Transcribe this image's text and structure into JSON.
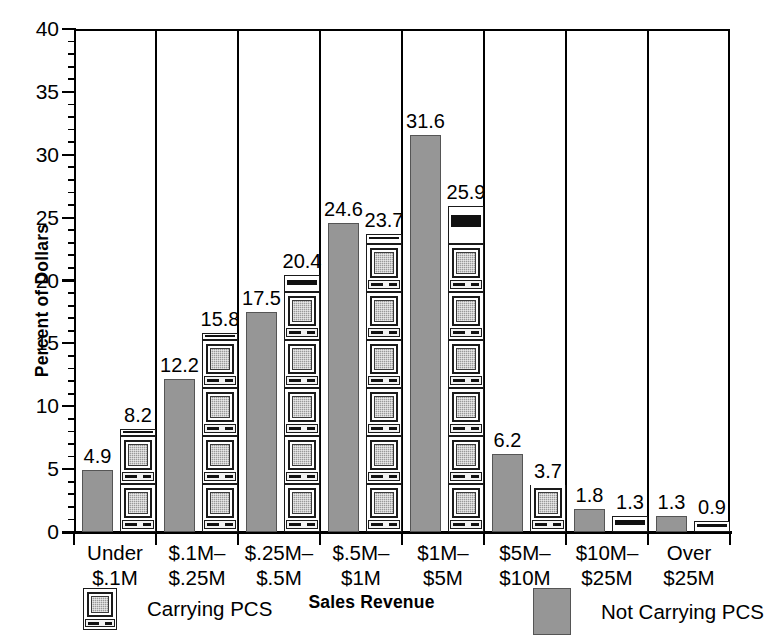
{
  "chart_data": {
    "type": "bar",
    "title": "",
    "xlabel": "Sales Revenue",
    "ylabel": "Percent of Dollars",
    "ylim": [
      0,
      40
    ],
    "ytick_step": 5,
    "yminor_step": 1,
    "grid": false,
    "legend_position": "bottom",
    "categories": [
      "Under\n$.1M",
      "$.1M–\n$.25M",
      "$.25M–\n$.5M",
      "$.5M–\n$1M",
      "$1M–\n$5M",
      "$5M–\n$10M",
      "$10M–\n$25M",
      "Over\n$25M"
    ],
    "category_lines": [
      [
        "Under",
        "$.1M"
      ],
      [
        "$.1M–",
        "$.25M"
      ],
      [
        "$.25M–",
        "$.5M"
      ],
      [
        "$.5M–",
        "$1M"
      ],
      [
        "$1M–",
        "$5M"
      ],
      [
        "$5M–",
        "$10M"
      ],
      [
        "$10M–",
        "$25M"
      ],
      [
        "Over",
        "$25M"
      ]
    ],
    "ytick_labels": [
      "0",
      "5",
      "10",
      "15",
      "20",
      "25",
      "30",
      "35",
      "40"
    ],
    "ytick_values": [
      0,
      5,
      10,
      15,
      20,
      25,
      30,
      35,
      40
    ],
    "series": [
      {
        "name": "Not Carrying PCS",
        "style": "solid-gray",
        "color": "#969696",
        "values": [
          4.9,
          12.2,
          17.5,
          24.6,
          31.6,
          6.2,
          1.8,
          1.3
        ],
        "labels": [
          "4.9",
          "12.2",
          "17.5",
          "24.6",
          "31.6",
          "6.2",
          "1.8",
          "1.3"
        ]
      },
      {
        "name": "Carrying PCS",
        "style": "pictogram-pc",
        "color": "#9a9a9a",
        "values": [
          8.2,
          15.8,
          20.4,
          23.7,
          25.9,
          3.7,
          1.3,
          0.9
        ],
        "labels": [
          "8.2",
          "15.8",
          "20.4",
          "23.7",
          "25.9",
          "3.7",
          "1.3",
          "0.9"
        ]
      }
    ]
  },
  "legend": {
    "carrying_label": "Carrying PCS",
    "not_carrying_label": "Not Carrying PCS"
  },
  "axes": {
    "y_title": "Percent of Dollars",
    "x_title": "Sales Revenue"
  }
}
